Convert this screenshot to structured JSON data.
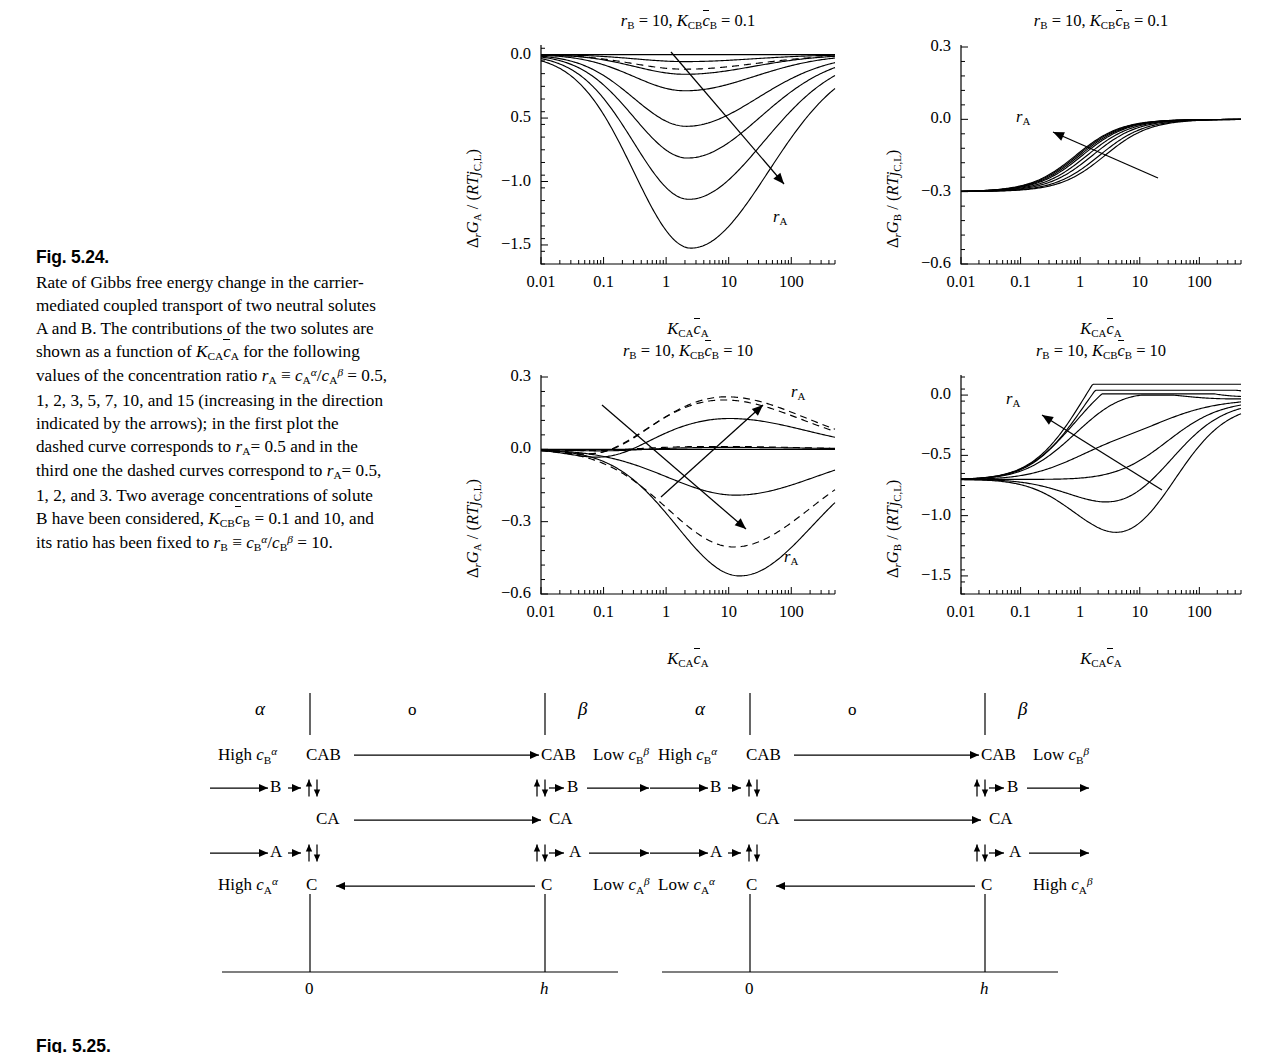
{
  "figure": {
    "number": "Fig. 5.24.",
    "caption_lines": [
      "Rate of Gibbs free energy change in the",
      "carrier-mediated coupled transport of two",
      "neutral solutes A and B. The contributions",
      "of the two solutes are shown as a function",
      "of K_CA c̄_A for the following values of the",
      "concentration ratio r_A ≡ c_A^α/c_A^β = 0.5, 1,",
      "2, 3, 5, 7, 10, and 15 (increasing in the",
      "direction indicated by the arrows); in the",
      "first plot the dashed curve corresponds to",
      "r_A = 0.5 and in the third one the dashed",
      "curves correspond to r_A = 0.5, 1, 2, and 3.",
      "Two average concentrations of solute B",
      "have been considered, K_CB c̄_B = 0.1 and",
      "10, and its ratio has been fixed to",
      "r_B ≡ c_B^α/c_B^β = 10."
    ],
    "next_figure_number": "Fig. 5.25."
  },
  "chart_data": [
    {
      "id": "plot-top-left",
      "type": "line",
      "title": "r_B = 10, K_CB c̄_B = 0.1",
      "title_parts": {
        "rb": "r",
        "rb_sub": "B",
        "eq1": "= 10,",
        "k": "K",
        "k_sub": "CB",
        "c": "c",
        "c_sub": "B",
        "eq2": "= 0.1"
      },
      "xlabel": "K_CA c̄_A",
      "ylabel": "Δ_r G_A / (RT j_C,L)",
      "ylabel_parts": {
        "delta": "Δ",
        "delta_sub": "r",
        "g": "G",
        "g_sub": "A",
        "slash": "/ (",
        "rt": "RT",
        "j": "j",
        "j_sub": "C,L",
        "close": ")"
      },
      "xscale": "log",
      "xlim": [
        0.01,
        500
      ],
      "ylim": [
        -1.65,
        0.06
      ],
      "xticks": [
        0.01,
        0.1,
        1,
        10,
        100
      ],
      "xticklabels": [
        "0.01",
        "0.1",
        "1",
        "10",
        "100"
      ],
      "yticks": [
        0.0,
        -0.5,
        -1.0,
        -1.5
      ],
      "yticklabels": [
        "0.0",
        "0.5",
        "-1.0",
        "-1.5"
      ],
      "arrow_label": "r_A",
      "series": [
        {
          "name": "r_A = 0.5",
          "style": "dashed",
          "peak_x": 2.0,
          "min_y": -0.115,
          "width": 1.05
        },
        {
          "name": "r_A = 1",
          "style": "solid",
          "peak_x": 2.0,
          "min_y": -0.055,
          "width": 1.0
        },
        {
          "name": "r_A = 2",
          "style": "solid",
          "peak_x": 2.0,
          "min_y": -0.155,
          "width": 1.0
        },
        {
          "name": "r_A = 3",
          "style": "solid",
          "peak_x": 2.0,
          "min_y": -0.285,
          "width": 1.02
        },
        {
          "name": "r_A = 5",
          "style": "solid",
          "peak_x": 2.1,
          "min_y": -0.565,
          "width": 1.05
        },
        {
          "name": "r_A = 7",
          "style": "solid",
          "peak_x": 2.2,
          "min_y": -0.815,
          "width": 1.07
        },
        {
          "name": "r_A = 10",
          "style": "solid",
          "peak_x": 2.3,
          "min_y": -1.14,
          "width": 1.1
        },
        {
          "name": "r_A = 15",
          "style": "solid",
          "peak_x": 2.5,
          "min_y": -1.525,
          "width": 1.14
        }
      ]
    },
    {
      "id": "plot-top-right",
      "type": "line",
      "title": "r_B = 10, K_CB c̄_B = 0.1",
      "title_parts": {
        "rb": "r",
        "rb_sub": "B",
        "eq1": "= 10,",
        "k": "K",
        "k_sub": "CB",
        "c": "c",
        "c_sub": "B",
        "eq2": "= 0.1"
      },
      "xlabel": "K_CA c̄_A",
      "ylabel": "Δ_r G_B / (RT j_C,L)",
      "ylabel_parts": {
        "delta": "Δ",
        "delta_sub": "r",
        "g": "G",
        "g_sub": "B",
        "slash": "/ (",
        "rt": "RT",
        "j": "j",
        "j_sub": "C,L",
        "close": ")"
      },
      "xscale": "log",
      "xlim": [
        0.01,
        500
      ],
      "ylim": [
        -0.6,
        0.3
      ],
      "xticks": [
        0.01,
        0.1,
        1,
        10,
        100
      ],
      "xticklabels": [
        "0.01",
        "0.1",
        "1",
        "10",
        "100"
      ],
      "yticks": [
        0.3,
        0.0,
        -0.3,
        -0.6
      ],
      "yticklabels": [
        "0.3",
        "0.0",
        "-0.3",
        "-0.6"
      ],
      "arrow_label": "r_A",
      "plateau_low": -0.3,
      "plateau_high": 0.0,
      "series": [
        {
          "name": "r_A = 0.5",
          "style": "solid",
          "x_half": 2.6
        },
        {
          "name": "r_A = 1",
          "style": "solid",
          "x_half": 2.1
        },
        {
          "name": "r_A = 2",
          "style": "solid",
          "x_half": 1.6
        },
        {
          "name": "r_A = 3",
          "style": "solid",
          "x_half": 1.3
        },
        {
          "name": "r_A = 5",
          "style": "solid",
          "x_half": 1.08
        },
        {
          "name": "r_A = 7",
          "style": "solid",
          "x_half": 0.98
        },
        {
          "name": "r_A = 10",
          "style": "solid",
          "x_half": 0.9
        },
        {
          "name": "r_A = 15",
          "style": "solid",
          "x_half": 0.84
        }
      ]
    },
    {
      "id": "plot-bottom-left",
      "type": "line",
      "title": "r_B = 10, K_CB c̄_B = 10",
      "title_parts": {
        "rb": "r",
        "rb_sub": "B",
        "eq1": "= 10,",
        "k": "K",
        "k_sub": "CB",
        "c": "c",
        "c_sub": "B",
        "eq2": "= 10"
      },
      "xlabel": "K_CA c̄_A",
      "ylabel": "Δ_r G_A / (RT j_C,L)",
      "ylabel_parts": {
        "delta": "Δ",
        "delta_sub": "r",
        "g": "G",
        "g_sub": "A",
        "slash": "/ (",
        "rt": "RT",
        "j": "j",
        "j_sub": "C,L",
        "close": ")"
      },
      "xscale": "log",
      "xlim": [
        0.01,
        500
      ],
      "ylim": [
        -0.6,
        0.3
      ],
      "xticks": [
        0.01,
        0.1,
        1,
        10,
        100
      ],
      "xticklabels": [
        "0.01",
        "0.1",
        "1",
        "10",
        "100"
      ],
      "yticks": [
        0.3,
        0.0,
        -0.3,
        -0.6
      ],
      "yticklabels": [
        "0.3",
        "0.0",
        "-0.3",
        "-0.6"
      ],
      "arrow_label_upper": "r_A",
      "arrow_label_lower": "r_A",
      "series": [
        {
          "name": "r_A = 0.5",
          "style": "dashed",
          "peak_x": 9.0,
          "amp": 0.218,
          "sign": "pos",
          "width": 1.22
        },
        {
          "name": "r_A = 1",
          "style": "dashed",
          "peak_x": 8.0,
          "amp": 0.205,
          "sign": "pos",
          "width": 1.22
        },
        {
          "name": "r_A = 2",
          "style": "dashed",
          "peak_x": 6.0,
          "amp": 0.012,
          "sign": "pos",
          "width": 1.3
        },
        {
          "name": "r_A = 3",
          "style": "dashed",
          "peak_x": 12.0,
          "amp": -0.405,
          "sign": "neg",
          "width": 1.18
        },
        {
          "name": "r_A = 5",
          "style": "solid",
          "peak_x": 10.0,
          "amp": 0.128,
          "sign": "pos",
          "width": 1.2
        },
        {
          "name": "r_A = 7",
          "style": "solid",
          "peak_x": 9.0,
          "amp": 0.008,
          "sign": "pos",
          "width": 1.3
        },
        {
          "name": "r_A = 10",
          "style": "solid",
          "peak_x": 13.0,
          "amp": -0.19,
          "sign": "neg",
          "width": 1.22
        },
        {
          "name": "r_A = 15",
          "style": "solid",
          "peak_x": 15.0,
          "amp": -0.525,
          "sign": "neg",
          "width": 1.12
        }
      ]
    },
    {
      "id": "plot-bottom-right",
      "type": "line",
      "title": "r_B = 10, K_CB c̄_B = 10",
      "title_parts": {
        "rb": "r",
        "rb_sub": "B",
        "eq1": "= 10,",
        "k": "K",
        "k_sub": "CB",
        "c": "c",
        "c_sub": "B",
        "eq2": "= 10"
      },
      "xlabel": "K_CA c̄_A",
      "ylabel": "Δ_r G_B / (RT j_C,L)",
      "ylabel_parts": {
        "delta": "Δ",
        "delta_sub": "r",
        "g": "G",
        "g_sub": "B",
        "slash": "/ (",
        "rt": "RT",
        "j": "j",
        "j_sub": "C,L",
        "close": ")"
      },
      "xscale": "log",
      "xlim": [
        0.01,
        500
      ],
      "ylim": [
        -1.65,
        0.15
      ],
      "xticks": [
        0.01,
        0.1,
        1,
        10,
        100
      ],
      "xticklabels": [
        "0.01",
        "0.1",
        "1",
        "10",
        "100"
      ],
      "yticks": [
        0.0,
        -0.5,
        -1.0,
        -1.5
      ],
      "yticklabels": [
        "0.0",
        "-0.5",
        "-1.0",
        "-1.5"
      ],
      "arrow_label": "r_A",
      "plateau_start": -0.7,
      "series": [
        {
          "name": "r_A = 15",
          "style": "solid",
          "dip": 0.0,
          "dip_x": 5,
          "rise_x": 40,
          "top": 0.07
        },
        {
          "name": "r_A = 10",
          "style": "solid",
          "dip": 0.0,
          "dip_x": 5,
          "rise_x": 70,
          "top": 0.02
        },
        {
          "name": "r_A = 7",
          "style": "solid",
          "dip": -0.08,
          "dip_x": 4,
          "rise_x": 110,
          "top": -0.01
        },
        {
          "name": "r_A = 5",
          "style": "solid",
          "dip": -0.2,
          "dip_x": 4,
          "rise_x": 150,
          "top": -0.02
        },
        {
          "name": "r_A = 3",
          "style": "solid",
          "dip": -0.48,
          "dip_x": 4,
          "rise_x": 200,
          "top": -0.03
        },
        {
          "name": "r_A = 2",
          "style": "solid",
          "dip": -0.72,
          "dip_x": 4.5,
          "rise_x": 260,
          "top": -0.04
        },
        {
          "name": "r_A = 1",
          "style": "solid",
          "dip": -0.95,
          "dip_x": 5,
          "rise_x": 330,
          "top": -0.05
        },
        {
          "name": "r_A = 0.5",
          "style": "solid",
          "dip": -1.2,
          "dip_x": 5.5,
          "rise_x": 430,
          "top": -0.07
        }
      ]
    }
  ],
  "scheme": {
    "panels": [
      {
        "id": "scheme-left",
        "phase_alpha": "α",
        "phase_membrane": "o",
        "phase_beta": "β",
        "left_top_conc": "High c_B^α",
        "right_top_conc": "Low c_B^β",
        "left_bottom_conc": "High c_A^α",
        "right_bottom_conc": "Low c_A^β",
        "species_cab": "CAB",
        "species_ca": "CA",
        "species_c": "C",
        "species_b": "B",
        "species_a": "A",
        "axis_zero": "0",
        "axis_h": "h"
      },
      {
        "id": "scheme-right",
        "phase_alpha": "α",
        "phase_membrane": "o",
        "phase_beta": "β",
        "left_top_conc": "High c_B^α",
        "right_top_conc": "Low c_B^β",
        "left_bottom_conc": "Low c_A^α",
        "right_bottom_conc": "High c_A^β",
        "species_cab": "CAB",
        "species_ca": "CA",
        "species_c": "C",
        "species_b": "B",
        "species_a": "A",
        "axis_zero": "0",
        "axis_h": "h"
      }
    ]
  }
}
